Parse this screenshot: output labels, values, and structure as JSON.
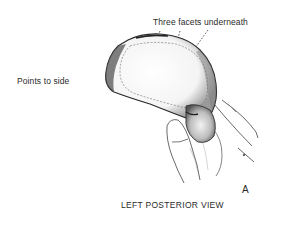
{
  "figure": {
    "panel_letter": "A",
    "caption": "LEFT POSTERIOR VIEW",
    "annotations": {
      "top": "Three facets underneath",
      "left": "Points to side"
    },
    "colors": {
      "ink": "#2a2a2a",
      "shade": "#555555",
      "background": "#ffffff"
    }
  }
}
